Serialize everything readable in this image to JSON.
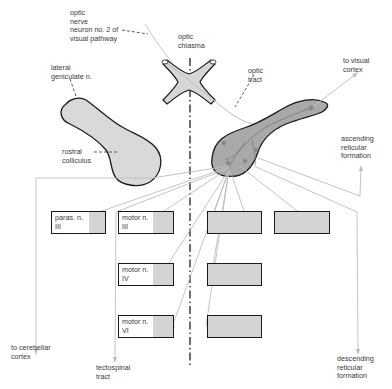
{
  "diagram": {
    "labels": {
      "optic_nerve": "optic\nnerve\nneuron no. 2 of\nvisual pathway",
      "optic_chiasma": "optic\nchiasma",
      "lateral_geniculate": "lateral\ngeniculate n.",
      "optic_tract": "optic\ntract",
      "to_visual_cortex": "to visual\ncortex",
      "rostral_colliculus": "rostral\ncolliculus",
      "ascending_reticular": "ascending\nreticular\nformation",
      "to_cerebellar_cortex": "to cerebellar\ncortex",
      "tectospinal_tract": "tectospinal\ntract",
      "descending_reticular": "descending\nreticular\nformation"
    },
    "nuclei_boxes": [
      {
        "id": "paras-n-iii",
        "label": "paras. n.\nIII",
        "side": "left"
      },
      {
        "id": "motor-n-iii-left",
        "label": "motor n.\nIII",
        "side": "left"
      },
      {
        "id": "motor-n-iv-left",
        "label": "motor n.\nIV",
        "side": "left"
      },
      {
        "id": "motor-n-vi-left",
        "label": "motor n.\nVI",
        "side": "left"
      },
      {
        "id": "motor-n-iii-right",
        "label": "",
        "side": "right"
      },
      {
        "id": "paras-n-iii-right",
        "label": "",
        "side": "right"
      },
      {
        "id": "motor-n-iv-right",
        "label": "",
        "side": "right"
      },
      {
        "id": "motor-n-vi-right",
        "label": "",
        "side": "right"
      }
    ],
    "colors": {
      "structure_fill_light": "#d8d8d8",
      "structure_fill_dark": "#a8a8a8",
      "outline": "#1a1a1a",
      "projection_lines": "#b8b8b8",
      "midline": "#222222",
      "text": "#3a3a3a"
    }
  }
}
